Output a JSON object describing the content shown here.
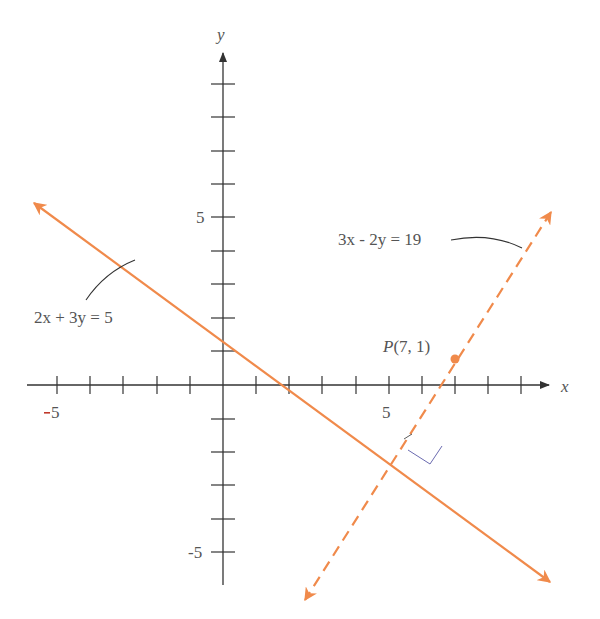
{
  "figure": {
    "axes": {
      "x_label": "x",
      "y_label": "y",
      "x_tick_labels": [
        {
          "value": -5,
          "text": "-5"
        },
        {
          "value": 5,
          "text": "5"
        }
      ],
      "y_tick_labels": [
        {
          "value": 5,
          "text": "5"
        },
        {
          "value": -5,
          "text": "-5"
        }
      ],
      "x_range": [
        -6,
        10
      ],
      "y_range": [
        -6,
        10
      ]
    },
    "line1": {
      "equation": "2x + 3y = 5",
      "style": "solid",
      "color": "#F08A4B"
    },
    "line2": {
      "equation": "3x - 2y = 19",
      "style": "dashed",
      "color": "#F08A4B"
    },
    "point": {
      "label_name": "P",
      "label_coords": "(7, 1)",
      "x": 7,
      "y": 1
    },
    "intersection": {
      "x": 5,
      "y": -1.67,
      "right_angle_marker": true
    }
  },
  "colors": {
    "line": "#F08A4B",
    "axis": "#333333",
    "text": "#555555",
    "leader": "#333333",
    "minus_accent": "#C0392B"
  }
}
